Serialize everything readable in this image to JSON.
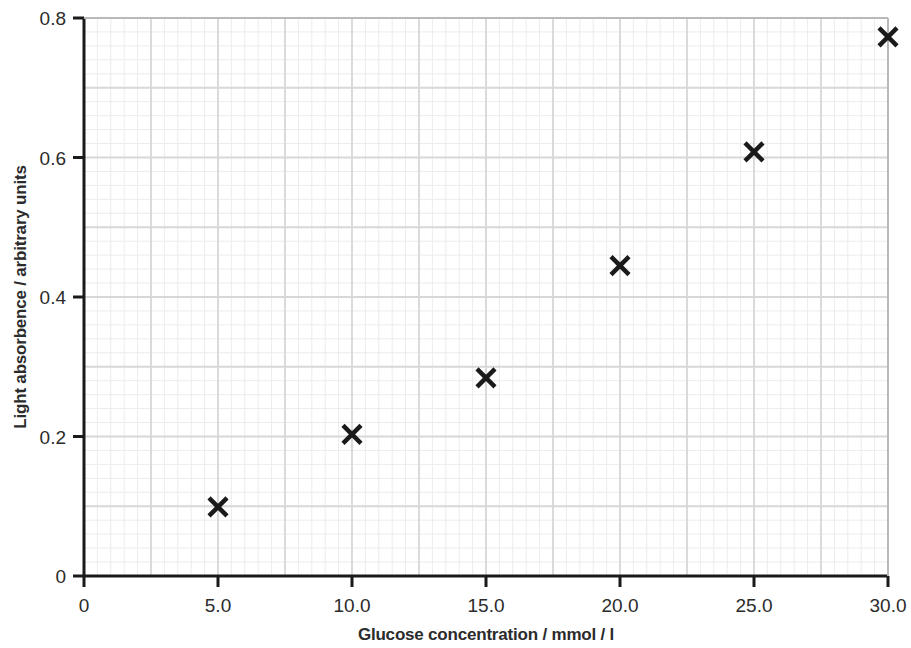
{
  "chart_data": {
    "type": "scatter",
    "title": "",
    "xlabel": "Glucose concentration / mmol / l",
    "ylabel": "Light absorbence / arbitrary units",
    "xlim": [
      0,
      30
    ],
    "ylim": [
      0,
      0.8
    ],
    "xticks": [
      0,
      5,
      10,
      15,
      20,
      25,
      30
    ],
    "xticklabels": [
      "0",
      "5.0",
      "10.0",
      "15.0",
      "20.0",
      "25.0",
      "30.0"
    ],
    "yticks": [
      0,
      0.2,
      0.4,
      0.6,
      0.8
    ],
    "yticklabels": [
      "0",
      "0.2",
      "0.4",
      "0.6",
      "0.8"
    ],
    "grid": true,
    "grid_minor": true,
    "grid_minor_step_x": 0.5,
    "grid_minor_step_y": 0.02,
    "grid_major_step_x": 2.5,
    "grid_major_step_y": 0.1,
    "legend": "none",
    "marker": "x",
    "marker_color": "#1a1a1a",
    "grid_color": "#d8d8d8",
    "grid_minor_color": "#ececec",
    "axis_color": "#1a1a1a",
    "x": [
      5.0,
      10.0,
      15.0,
      20.0,
      25.0,
      30.0
    ],
    "y": [
      0.099,
      0.203,
      0.284,
      0.445,
      0.608,
      0.773
    ],
    "points": [
      {
        "x": 5.0,
        "y": 0.099
      },
      {
        "x": 10.0,
        "y": 0.203
      },
      {
        "x": 15.0,
        "y": 0.284
      },
      {
        "x": 20.0,
        "y": 0.445
      },
      {
        "x": 25.0,
        "y": 0.608
      },
      {
        "x": 30.0,
        "y": 0.773
      }
    ]
  }
}
